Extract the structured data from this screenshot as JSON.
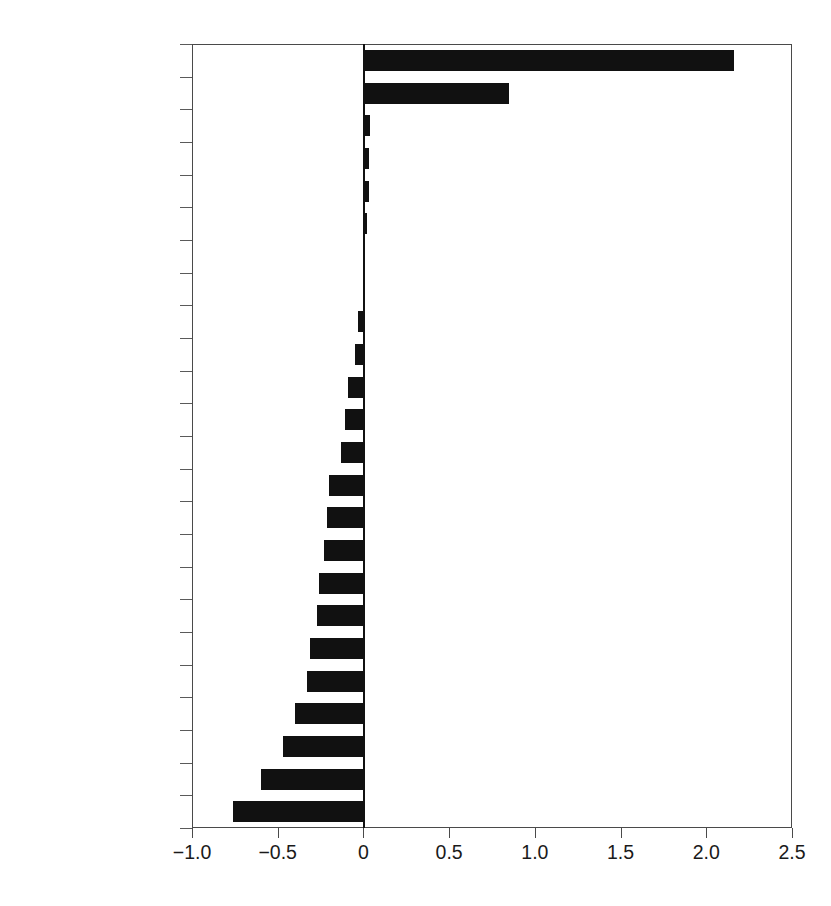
{
  "chart_data": {
    "type": "bar",
    "orientation": "horizontal",
    "title": "",
    "subtitle": "",
    "xlabel": "",
    "ylabel": "",
    "xlim": [
      -1.0,
      2.5
    ],
    "xticks": [
      -1.0,
      -0.5,
      0,
      0.5,
      1.0,
      1.5,
      2.0,
      2.5
    ],
    "xtick_labels": [
      "−1.0",
      "−0.5",
      "0",
      "0.5",
      "1.0",
      "1.5",
      "2.0",
      "2.5"
    ],
    "grid": false,
    "legend": false,
    "bar_color": "#111111",
    "categories": [
      "China",
      "United States",
      "Brunei",
      "Chile",
      "New Zealand",
      "Australia",
      "Hong Kong",
      "European Union",
      "Russia",
      "Rest of world",
      "Japan",
      "Peru",
      "India",
      "Indonesia",
      "Other ASEAN",
      "Canada",
      "Mexico",
      "Korea",
      "Singapore",
      "Philippines",
      "Taiwan",
      "Malaysia",
      "Thailand",
      "Vietnam"
    ],
    "values": [
      2.16,
      0.85,
      0.04,
      0.03,
      0.03,
      0.02,
      0.01,
      0.005,
      -0.03,
      -0.05,
      -0.09,
      -0.11,
      -0.13,
      -0.2,
      -0.21,
      -0.23,
      -0.26,
      -0.27,
      -0.31,
      -0.33,
      -0.4,
      -0.47,
      -0.6,
      -0.76
    ]
  }
}
